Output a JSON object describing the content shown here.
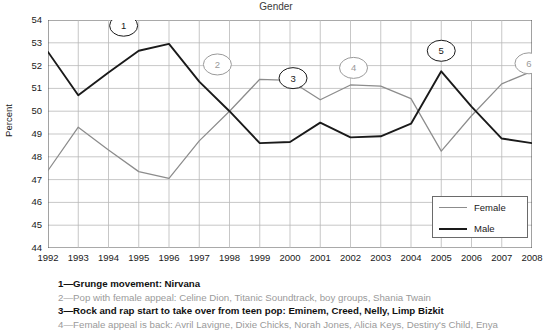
{
  "chart_data": {
    "type": "line",
    "title": "Gender",
    "xlabel": "",
    "ylabel": "Percent",
    "grid": true,
    "legend_position": "bottom-right",
    "ylim": [
      44,
      54
    ],
    "yticks": [
      44,
      45,
      46,
      47,
      48,
      49,
      50,
      51,
      52,
      53,
      54
    ],
    "categories": [
      1992,
      1993,
      1994,
      1995,
      1996,
      1997,
      1998,
      1999,
      2000,
      2001,
      2002,
      2003,
      2004,
      2005,
      2006,
      2007,
      2008
    ],
    "x": [
      "1992",
      "1993",
      "1994",
      "1995",
      "1996",
      "1997",
      "1998",
      "1999",
      "2000",
      "2001",
      "2002",
      "2003",
      "2004",
      "2005",
      "2006",
      "2007",
      "2008"
    ],
    "series": [
      {
        "name": "Female",
        "color": "#8c8c8c",
        "values": [
          47.4,
          49.3,
          48.3,
          47.35,
          47.05,
          48.7,
          50.0,
          51.4,
          51.35,
          50.5,
          51.15,
          51.1,
          50.55,
          48.25,
          49.8,
          51.2,
          51.75
        ]
      },
      {
        "name": "Male",
        "color": "#1a1a1a",
        "values": [
          52.6,
          50.7,
          51.7,
          52.65,
          52.95,
          51.3,
          50.0,
          48.6,
          48.65,
          49.5,
          48.85,
          48.9,
          49.45,
          51.75,
          50.2,
          48.8,
          48.6
        ]
      }
    ],
    "annotations": [
      {
        "label": "1",
        "x": 1994.5,
        "y": 53.75,
        "color": "#1a1a1a"
      },
      {
        "label": "2",
        "x": 1997.6,
        "y": 52.05,
        "color": "#9a9a9a"
      },
      {
        "label": "3",
        "x": 2000.1,
        "y": 51.45,
        "color": "#1a1a1a"
      },
      {
        "label": "4",
        "x": 2002.1,
        "y": 51.9,
        "color": "#9a9a9a"
      },
      {
        "label": "5",
        "x": 2005.0,
        "y": 52.65,
        "color": "#1a1a1a"
      },
      {
        "label": "6",
        "x": 2007.9,
        "y": 52.1,
        "color": "#9a9a9a"
      }
    ]
  },
  "legend": {
    "items": [
      {
        "label": "Female",
        "color": "#8c8c8c"
      },
      {
        "label": "Male",
        "color": "#1a1a1a"
      }
    ]
  },
  "notes": [
    {
      "text": "1—Grunge movement: Nirvana",
      "style": "dark"
    },
    {
      "text": "2—Pop with female appeal: Celine Dion, Titanic Soundtrack, boy groups, Shania Twain",
      "style": "gray"
    },
    {
      "text": "3—Rock and rap start to take over from teen pop: Eminem, Creed, Nelly, Limp Bizkit",
      "style": "dark"
    },
    {
      "text": "4—Female appeal is back: Avril Lavigne, Dixie Chicks, Norah Jones, Alicia Keys, Destiny's Child, Enya",
      "style": "gray"
    }
  ]
}
